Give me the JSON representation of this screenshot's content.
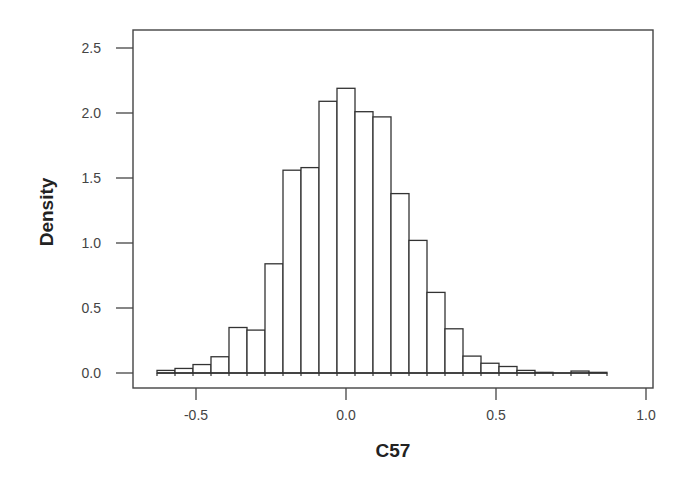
{
  "chart_data": {
    "type": "bar",
    "subtype": "histogram",
    "title": "",
    "xlabel": "C57",
    "ylabel": "Density",
    "xlim": [
      -0.7,
      1.02
    ],
    "ylim": [
      -0.12,
      2.63
    ],
    "xticks": [
      -0.5,
      0.0,
      0.5,
      1.0
    ],
    "xtick_labels": [
      "-0.5",
      "0.0",
      "0.5",
      "1.0"
    ],
    "yticks": [
      0.0,
      0.5,
      1.0,
      1.5,
      2.0,
      2.5
    ],
    "ytick_labels": [
      "0.0",
      "0.5",
      "1.0",
      "1.5",
      "2.0",
      "2.5"
    ],
    "grid": false,
    "legend": null,
    "bin_width": 0.06,
    "bin_edges": [
      -0.63,
      -0.57,
      -0.51,
      -0.45,
      -0.39,
      -0.33,
      -0.27,
      -0.21,
      -0.15,
      -0.09,
      -0.03,
      0.03,
      0.09,
      0.15,
      0.21,
      0.27,
      0.33,
      0.39,
      0.45,
      0.51,
      0.57,
      0.63,
      0.69,
      0.75,
      0.81,
      0.87
    ],
    "categories": [
      "-0.60",
      "-0.54",
      "-0.48",
      "-0.42",
      "-0.36",
      "-0.30",
      "-0.24",
      "-0.18",
      "-0.12",
      "-0.06",
      "0.00",
      "0.06",
      "0.12",
      "0.18",
      "0.24",
      "0.30",
      "0.36",
      "0.42",
      "0.48",
      "0.54",
      "0.60",
      "0.66",
      "0.72",
      "0.78",
      "0.84"
    ],
    "values": [
      0.02,
      0.035,
      0.065,
      0.125,
      0.35,
      0.33,
      0.84,
      1.56,
      1.58,
      2.09,
      2.19,
      2.01,
      1.97,
      1.38,
      1.02,
      0.62,
      0.34,
      0.13,
      0.075,
      0.05,
      0.02,
      0.005,
      0.0,
      0.015,
      0.005
    ]
  },
  "layout": {
    "plot_px": {
      "left": 133,
      "top": 30,
      "right": 653,
      "bottom": 388
    },
    "x_px_per_unit": 300,
    "x_zero_px": 346,
    "y_px_per_unit": 130,
    "y_zero_px": 373
  }
}
